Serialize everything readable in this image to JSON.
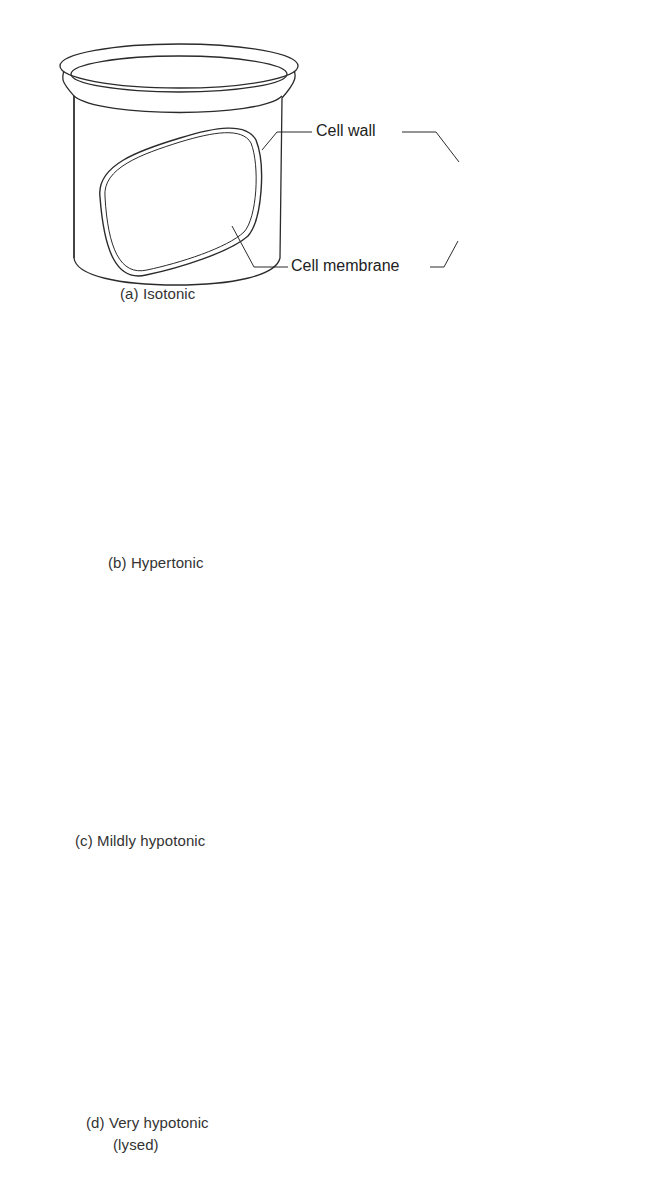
{
  "figure": {
    "panels": [
      {
        "id": "a",
        "caption": "(a) Isotonic",
        "solution_fill": "#ffffff"
      },
      {
        "id": "b",
        "caption": "(b) Hypertonic",
        "solution_fill": "#dcdcdc"
      },
      {
        "id": "c",
        "caption": "(c) Mildly hypotonic",
        "solution_fill": "#d4d4d4"
      },
      {
        "id": "d",
        "caption_line1": "(d) Very hypotonic",
        "caption_line2": "(lysed)",
        "solution_fill": "#a9a9a9"
      }
    ],
    "callouts": {
      "cell_wall": "Cell wall",
      "cell_membrane": "Cell membrane"
    },
    "colors": {
      "line": "#2b2b2b",
      "arrow": "#5a5a5a",
      "background": "#ffffff"
    }
  }
}
